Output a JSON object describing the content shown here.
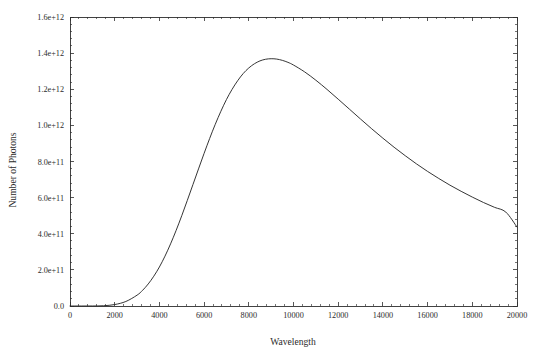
{
  "chart_data": {
    "type": "line",
    "title": "",
    "xlabel": "Wavelength",
    "ylabel": "Number of Photons",
    "xlim": [
      0,
      20000
    ],
    "ylim": [
      0,
      1600000000000
    ],
    "grid": false,
    "legend": null,
    "xticks": [
      0,
      2000,
      4000,
      6000,
      8000,
      10000,
      12000,
      14000,
      16000,
      18000,
      20000
    ],
    "xtick_labels": [
      "0",
      "2000",
      "4000",
      "6000",
      "8000",
      "10000",
      "12000",
      "14000",
      "16000",
      "18000",
      "20000"
    ],
    "yticks": [
      0,
      200000000000,
      400000000000,
      600000000000,
      800000000000,
      1000000000000,
      1200000000000,
      1400000000000,
      1600000000000
    ],
    "ytick_labels": [
      "0.0",
      "2.0e+11",
      "4.0e+11",
      "6.0e+11",
      "8.0e+11",
      "1.0e+12",
      "1.2e+12",
      "1.4e+12",
      "1.6e+12"
    ],
    "minor_ticks_per_major": 5,
    "tick_direction": "in",
    "series": [
      {
        "name": "photon spectrum",
        "color": "#2a2a2a",
        "x": [
          0,
          500,
          1000,
          1500,
          2000,
          2500,
          3000,
          3250,
          3500,
          3750,
          4000,
          4250,
          4500,
          4750,
          5000,
          5250,
          5500,
          5750,
          6000,
          6250,
          6500,
          6750,
          7000,
          7250,
          7500,
          7750,
          8000,
          8250,
          8500,
          8750,
          9000,
          9250,
          9500,
          9750,
          10000,
          10500,
          11000,
          11500,
          12000,
          12500,
          13000,
          13500,
          14000,
          14500,
          15000,
          15500,
          16000,
          16500,
          17000,
          17500,
          18000,
          18500,
          19000,
          19500,
          20000
        ],
        "y": [
          0,
          0,
          100000000,
          1500000000,
          8000000000,
          25000000000,
          60000000000,
          87000000000,
          122000000000,
          165000000000,
          216000000000,
          276000000000,
          344000000000,
          419000000000,
          500000000000,
          585000000000,
          672000000000,
          759000000000,
          845000000000,
          928000000000,
          1006000000000,
          1078000000000,
          1143000000000,
          1199000000000,
          1247000000000,
          1287000000000,
          1318000000000,
          1341000000000,
          1357000000000,
          1366000000000,
          1369000000000,
          1367000000000,
          1360000000000,
          1349000000000,
          1334000000000,
          1296000000000,
          1250000000000,
          1199000000000,
          1145000000000,
          1090000000000,
          1035000000000,
          981000000000,
          929000000000,
          879000000000,
          832000000000,
          787000000000,
          745000000000,
          706000000000,
          669000000000,
          635000000000,
          603000000000,
          573000000000,
          546000000000,
          520000000000,
          437000000000
        ]
      }
    ],
    "peak": {
      "x": 9000,
      "y": 1369000000000,
      "label": "1.37e+12"
    },
    "endpoint": {
      "x": 20000,
      "y": 437000000000
    }
  },
  "figure": {
    "background_color": "#ffffff",
    "axis_color": "#2e2e2e",
    "text_color": "#2b2b2b"
  }
}
